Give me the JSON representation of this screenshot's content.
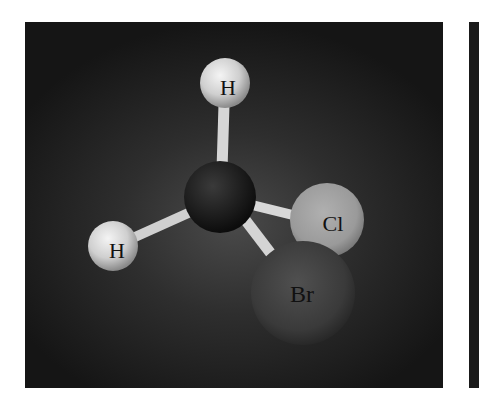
{
  "figure": {
    "atoms": [
      {
        "id": "h_top",
        "label": "H",
        "cx": 225,
        "cy": 83,
        "r": 25,
        "color": "#d8d8d8"
      },
      {
        "id": "carbon",
        "label": "",
        "cx": 220,
        "cy": 197,
        "r": 36,
        "color": "#1c1c1c"
      },
      {
        "id": "h_left",
        "label": "H",
        "cx": 113,
        "cy": 246,
        "r": 25,
        "color": "#d0d0d0"
      },
      {
        "id": "cl",
        "label": "Cl",
        "cx": 327,
        "cy": 220,
        "r": 37,
        "color": "#9a9a9a"
      },
      {
        "id": "br",
        "label": "Br",
        "cx": 303,
        "cy": 293,
        "r": 52,
        "color": "#3c3c3c"
      }
    ],
    "bonds": [
      {
        "from": "carbon",
        "to": "h_top"
      },
      {
        "from": "carbon",
        "to": "h_left"
      },
      {
        "from": "carbon",
        "to": "cl"
      },
      {
        "from": "carbon",
        "to": "br"
      }
    ],
    "labels": {
      "h_top": "H",
      "h_left": "H",
      "cl": "Cl",
      "br": "Br"
    }
  }
}
